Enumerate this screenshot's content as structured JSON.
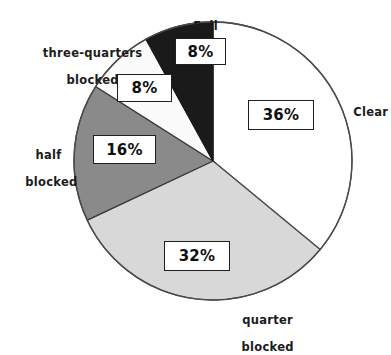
{
  "chart_data": {
    "type": "pie",
    "title": "",
    "subtitle": "",
    "xlabel": "",
    "ylabel": "",
    "legend_position": "none",
    "grid": false,
    "units": "percent",
    "total": 100,
    "start_angle_deg": 0,
    "direction": "clockwise",
    "categories": [
      "Clear",
      "quarter blocked",
      "half blocked",
      "three-quarters blocked",
      "Full"
    ],
    "values": [
      36,
      32,
      16,
      8,
      8
    ],
    "value_labels": [
      "36%",
      "32%",
      "16%",
      "8%",
      "8%"
    ],
    "slice_colors": [
      "#ffffff",
      "#d8d8d8",
      "#8a8a8a",
      "#fbfbfb",
      "#1a1a1a"
    ],
    "slices": [
      {
        "name": "Clear",
        "label": "Clear",
        "value": 36,
        "value_label": "36%",
        "fill": "#ffffff",
        "stroke": "#4a4a4a",
        "label_lines": [
          "Clear"
        ]
      },
      {
        "name": "quarter blocked",
        "label": "quarter blocked",
        "value": 32,
        "value_label": "32%",
        "fill": "#d8d8d8",
        "stroke": "#4a4a4a",
        "label_lines": [
          "quarter",
          "blocked"
        ]
      },
      {
        "name": "half blocked",
        "label": "half blocked",
        "value": 16,
        "value_label": "16%",
        "fill": "#8a8a8a",
        "stroke": "#3a3a3a",
        "label_lines": [
          "half",
          "blocked"
        ]
      },
      {
        "name": "three-quarters blocked",
        "label": "three-quarters blocked",
        "value": 8,
        "value_label": "8%",
        "fill": "#fbfbfb",
        "stroke": "#3a3a3a",
        "label_lines": [
          "three-quarters",
          "blocked"
        ]
      },
      {
        "name": "Full",
        "label": "Full",
        "value": 8,
        "value_label": "8%",
        "fill": "#1a1a1a",
        "stroke": "#1a1a1a",
        "label_lines": [
          "Full"
        ]
      }
    ]
  },
  "labels": {
    "full": "Full",
    "three_quarters_line1": "three-quarters",
    "three_quarters_line2": "blocked",
    "half_line1": "half",
    "half_line2": "blocked",
    "quarter_line1": "quarter",
    "quarter_line2": "blocked",
    "clear": "Clear"
  },
  "values": {
    "clear_pct": "36%",
    "quarter_pct": "32%",
    "half_pct": "16%",
    "three_quarters_pct": "8%",
    "full_pct": "8%"
  },
  "geometry": {
    "center_x": 213,
    "center_y": 161,
    "radius": 139
  },
  "colors": {
    "background": "#ffffff",
    "outline": "#4a4a4a",
    "text": "#1b1b1b",
    "box_border": "#202020",
    "slice_clear": "#ffffff",
    "slice_quarter": "#d8d8d8",
    "slice_half": "#8a8a8a",
    "slice_three_quarters": "#fbfbfb",
    "slice_full": "#1a1a1a"
  }
}
